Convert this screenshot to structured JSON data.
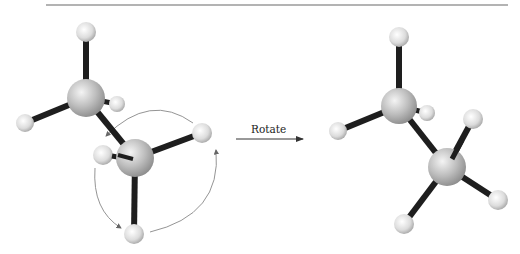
{
  "figure": {
    "arrow_label": "Rotate",
    "colors": {
      "background": "#ffffff",
      "rule": "#9a9a9a",
      "bond": "#1e1e1e",
      "carbon": "#b8b8b8",
      "hydrogen": "#e2e2e2",
      "arc": "#777777"
    },
    "molecules": [
      {
        "name": "ethane-before-rotation",
        "carbons": [
          {
            "x": 86,
            "y": 98,
            "r": 19
          },
          {
            "x": 135,
            "y": 158,
            "r": 19
          }
        ],
        "hydrogens": [
          {
            "x": 86,
            "y": 32,
            "r": 10,
            "bonded_to": 0
          },
          {
            "x": 25,
            "y": 123,
            "r": 9,
            "bonded_to": 0
          },
          {
            "x": 117,
            "y": 104,
            "r": 8,
            "bonded_to": 0
          },
          {
            "x": 202,
            "y": 133,
            "r": 10,
            "bonded_to": 1
          },
          {
            "x": 103,
            "y": 155,
            "r": 10,
            "bonded_to": 1
          },
          {
            "x": 134,
            "y": 234,
            "r": 10,
            "bonded_to": 1
          }
        ]
      },
      {
        "name": "ethane-after-rotation",
        "carbons": [
          {
            "x": 399,
            "y": 106,
            "r": 18
          },
          {
            "x": 447,
            "y": 167,
            "r": 19
          }
        ],
        "hydrogens": [
          {
            "x": 399,
            "y": 37,
            "r": 10,
            "bonded_to": 0
          },
          {
            "x": 338,
            "y": 131,
            "r": 9,
            "bonded_to": 0
          },
          {
            "x": 427,
            "y": 113,
            "r": 8,
            "bonded_to": 0
          },
          {
            "x": 473,
            "y": 119,
            "r": 10,
            "bonded_to": 1
          },
          {
            "x": 498,
            "y": 200,
            "r": 10,
            "bonded_to": 1
          },
          {
            "x": 404,
            "y": 224,
            "r": 10,
            "bonded_to": 1
          }
        ]
      }
    ]
  }
}
